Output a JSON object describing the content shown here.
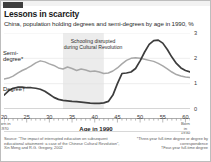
{
  "header": {
    "title": "Lessons in scarcity",
    "subtitle": "China, population holding degrees and semi-degrees by age in 1990, %",
    "marker": "red-rule"
  },
  "annotation": {
    "line1": "Schooling disrupted",
    "line2": "during Cultural Revolution"
  },
  "axis": {
    "x_label": "Age in 1990",
    "x_ticks": [
      "20",
      "25",
      "30",
      "35",
      "40",
      "45",
      "50",
      "55",
      "60"
    ],
    "y_ticks": [
      "0",
      "1",
      "2",
      "3"
    ],
    "born_left_label": "Born in",
    "born_left_year": "1970",
    "born_right_label": "Born in",
    "born_right_year": "1930"
  },
  "series_labels": {
    "semi": "Semi-\ndegree*",
    "semi_line1": "Semi-",
    "semi_line2": "degree*",
    "degree": "Degree†"
  },
  "source": "Source: “The impact of interrupted education on subsequent educational attainment: a case of the Chinese Cultural Revolution”, Xin Meng and R.G. Gregory, 2002",
  "footnotes": {
    "note1": "*Three-year full-time degree or degree by correspondence",
    "note2": "†Four-year full-time degree"
  },
  "colors": {
    "degree_line": "#3c3c3c",
    "semi_line": "#a8a8a8",
    "shade": "#ececec",
    "grid": "#e2e2e2",
    "accent": "#e3120b"
  },
  "chart_data": {
    "type": "line",
    "title": "Lessons in scarcity",
    "subtitle": "China, population holding degrees and semi-degrees by age in 1990, %",
    "xlabel": "Age in 1990",
    "ylabel": "%",
    "xlim": [
      20,
      61
    ],
    "ylim": [
      0,
      3
    ],
    "yticks": [
      0,
      1,
      2,
      3
    ],
    "xticks": [
      20,
      25,
      30,
      35,
      40,
      45,
      50,
      55,
      60
    ],
    "grid": true,
    "legend": "inline-labels",
    "shaded_region": {
      "label": "Schooling disrupted during Cultural Revolution",
      "x_start": 33,
      "x_end": 42
    },
    "x": [
      20,
      21,
      22,
      23,
      24,
      25,
      26,
      27,
      28,
      29,
      30,
      31,
      32,
      33,
      34,
      35,
      36,
      37,
      38,
      39,
      40,
      41,
      42,
      43,
      44,
      45,
      46,
      47,
      48,
      49,
      50,
      51,
      52,
      53,
      54,
      55,
      56,
      57,
      58,
      59,
      60,
      61
    ],
    "series": [
      {
        "name": "Semi-degree*",
        "color": "#a8a8a8",
        "values": [
          1.18,
          1.22,
          1.3,
          1.42,
          1.52,
          1.6,
          1.7,
          1.82,
          1.9,
          1.86,
          1.78,
          1.72,
          1.62,
          1.58,
          1.66,
          1.6,
          1.52,
          1.58,
          1.54,
          1.48,
          1.5,
          1.46,
          1.4,
          1.42,
          1.5,
          1.62,
          1.78,
          1.92,
          2.0,
          2.02,
          2.0,
          1.96,
          1.92,
          1.88,
          1.8,
          1.7,
          1.58,
          1.46,
          1.36,
          1.3,
          1.26,
          1.24
        ]
      },
      {
        "name": "Degree†",
        "color": "#3c3c3c",
        "values": [
          0.55,
          0.72,
          0.82,
          0.86,
          0.86,
          0.84,
          0.84,
          0.82,
          0.78,
          0.7,
          0.58,
          0.46,
          0.38,
          0.34,
          0.32,
          0.3,
          0.29,
          0.27,
          0.25,
          0.23,
          0.22,
          0.22,
          0.24,
          0.3,
          0.55,
          1.0,
          1.4,
          1.42,
          1.46,
          1.6,
          1.9,
          2.25,
          2.55,
          2.7,
          2.72,
          2.6,
          2.35,
          2.05,
          1.8,
          1.62,
          1.52,
          1.46
        ]
      }
    ]
  }
}
